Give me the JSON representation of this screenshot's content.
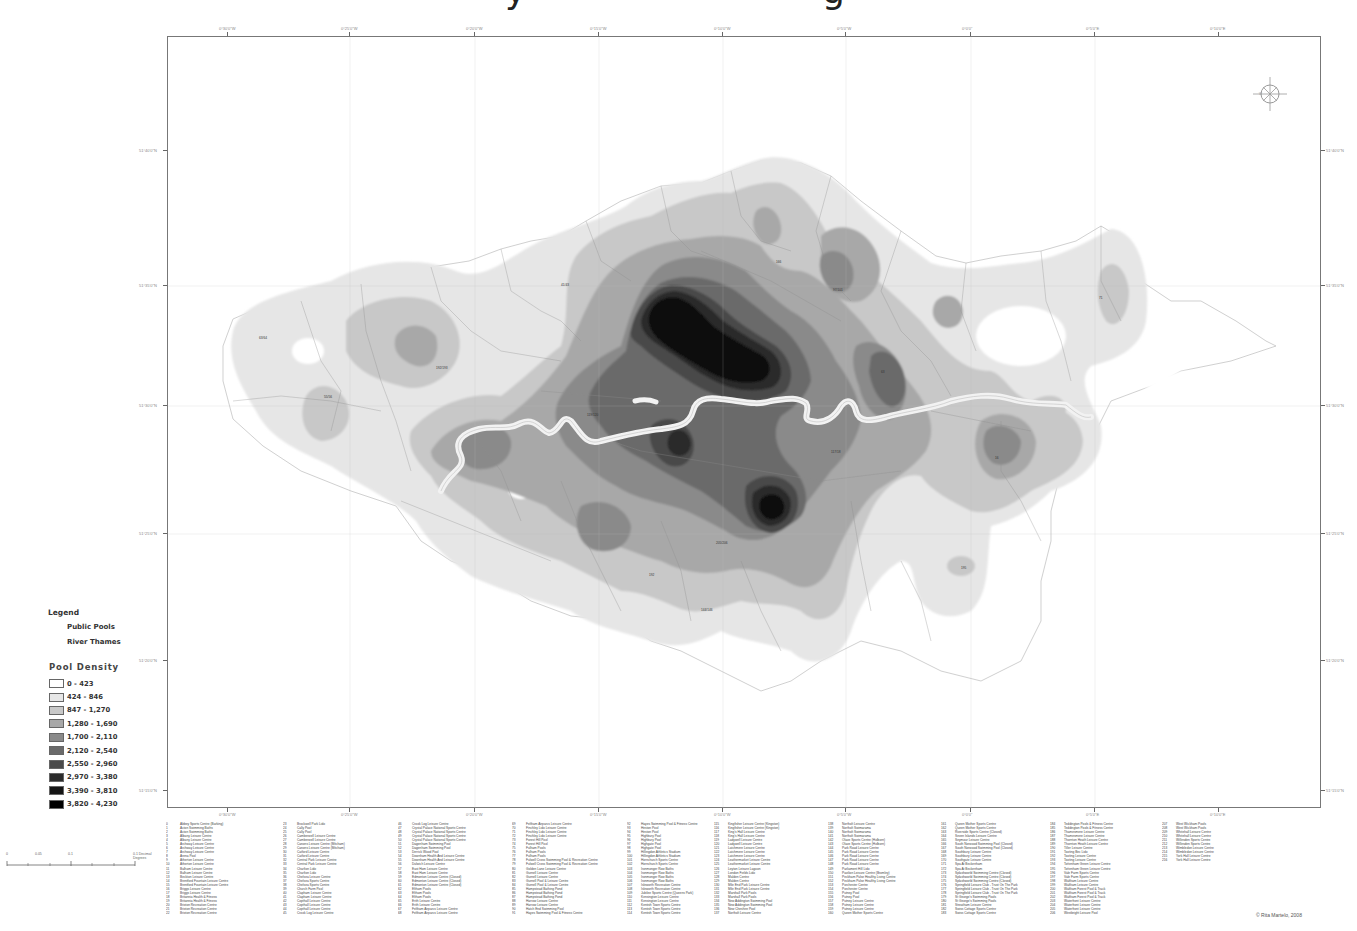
{
  "title": {
    "fragments": [
      {
        "text": "y",
        "left": 505
      },
      {
        "text": "g",
        "left": 822
      }
    ]
  },
  "map": {
    "frame": {
      "left": 167,
      "top": 36,
      "width": 1154,
      "height": 772
    },
    "top_ticks_x": [
      227,
      349,
      474,
      598,
      722,
      845,
      970,
      1094,
      1218
    ],
    "top_tick_labels": [
      "0°30'0\"W",
      "0°25'0\"W",
      "0°20'0\"W",
      "0°15'0\"W",
      "0°10'0\"W",
      "0°5'0\"W",
      "0°0'0\"",
      "0°5'0\"E",
      "0°10'0\"E"
    ],
    "bottom_tick_labels": [
      "0°30'0\"W",
      "0°25'0\"W",
      "0°20'0\"W",
      "0°15'0\"W",
      "0°10'0\"W",
      "0°5'0\"W",
      "0°0'0\"",
      "0°5'0\"E",
      "0°10'0\"E"
    ],
    "left_ticks_y": [
      150,
      285,
      405,
      533,
      660,
      790
    ],
    "left_tick_labels": [
      "51°40'0\"N",
      "51°35'0\"N",
      "51°30'0\"N",
      "51°25'0\"N",
      "51°20'0\"N",
      "51°15'0\"N"
    ],
    "right_tick_labels": [
      "51°40'0\"N",
      "51°35'0\"N",
      "51°30'0\"N",
      "51°25'0\"N",
      "51°20'0\"N",
      "51°15'0\"N"
    ],
    "compass_icon": "compass-rose-icon",
    "river_color": "#eeeeee"
  },
  "legend": {
    "title": "Legend",
    "items": [
      {
        "label": "Public Pools",
        "icon": "pool-point-icon"
      },
      {
        "label": "River Thames",
        "icon": "river-line-icon"
      }
    ]
  },
  "density": {
    "title": "Pool Density",
    "classes": [
      {
        "label": "0 - 423",
        "color": "#ffffff"
      },
      {
        "label": "424 - 846",
        "color": "#e6e6e6"
      },
      {
        "label": "847 - 1,270",
        "color": "#c8c8c8"
      },
      {
        "label": "1,280 - 1,690",
        "color": "#a8a8a8"
      },
      {
        "label": "1,700 - 2,110",
        "color": "#8a8a8a"
      },
      {
        "label": "2,120 - 2,540",
        "color": "#6a6a6a"
      },
      {
        "label": "2,550 - 2,960",
        "color": "#4a4a4a"
      },
      {
        "label": "2,970 - 3,380",
        "color": "#2c2c2c"
      },
      {
        "label": "3,390 - 3,810",
        "color": "#151515"
      },
      {
        "label": "3,820 - 4,230",
        "color": "#000000"
      }
    ]
  },
  "scale_bar": {
    "labels": [
      "0",
      "0.05",
      "0.1",
      "0.1 Decimal Degrees"
    ]
  },
  "footnotes": {
    "columns": [
      [
        [
          "0",
          "Abbey Sports Centre (Barking)"
        ],
        [
          "1",
          "Acton Swimming Baths"
        ],
        [
          "2",
          "Acton Swimming Baths"
        ],
        [
          "3",
          "Albany Leisure Centre"
        ],
        [
          "4",
          "Albany Leisure Centre"
        ],
        [
          "5",
          "Archway Leisure Centre"
        ],
        [
          "6",
          "Archway Leisure Centre"
        ],
        [
          "7",
          "Archway Leisure Centre"
        ],
        [
          "8",
          "Arena Pool"
        ],
        [
          "9",
          "Atherton Leisure Centre"
        ],
        [
          "10",
          "Atherton Leisure Centre"
        ],
        [
          "11",
          "Balham Leisure Centre"
        ],
        [
          "12",
          "Balham Leisure Centre"
        ],
        [
          "13",
          "Beckton Leisure Centre"
        ],
        [
          "14",
          "Brentford Fountain Leisure Centre"
        ],
        [
          "15",
          "Brentford Fountain Leisure Centre"
        ],
        [
          "16",
          "Briggs Leisure Centre"
        ],
        [
          "17",
          "Briggs Leisure Centre"
        ],
        [
          "18",
          "Britannia Health & Fitness"
        ],
        [
          "19",
          "Britannia Health & Fitness"
        ],
        [
          "20",
          "Brixton Recreation Centre"
        ],
        [
          "21",
          "Brixton Recreation Centre"
        ],
        [
          "22",
          "Brixton Recreation Centre"
        ]
      ],
      [
        [
          "23",
          "Brockwell Park Lido"
        ],
        [
          "24",
          "Cally Pool"
        ],
        [
          "25",
          "Cally Pool"
        ],
        [
          "26",
          "Camberwell Leisure Centre"
        ],
        [
          "27",
          "Camberwell Leisure Centre"
        ],
        [
          "28",
          "Canons Leisure Centre (Mitcham)"
        ],
        [
          "29",
          "Canons Leisure Centre (Mitcham)"
        ],
        [
          "30",
          "Catford Leisure Centre"
        ],
        [
          "31",
          "Catford Leisure Centre"
        ],
        [
          "32",
          "Central Park Leisure Centre"
        ],
        [
          "33",
          "Central Park Leisure Centre"
        ],
        [
          "34",
          "Charlton Lido"
        ],
        [
          "35",
          "Charlton Lido"
        ],
        [
          "36",
          "Chelsea Leisure Centre"
        ],
        [
          "37",
          "Chelsea Sports Centre"
        ],
        [
          "38",
          "Chelsea Sports Centre"
        ],
        [
          "39",
          "Church Farm Pool"
        ],
        [
          "40",
          "Clapham Leisure Centre"
        ],
        [
          "41",
          "Clapham Leisure Centre"
        ],
        [
          "42",
          "Copthall Leisure Centre"
        ],
        [
          "43",
          "Copthall Leisure Centre"
        ],
        [
          "44",
          "Copthall Leisure Centre"
        ],
        [
          "45",
          "Crook Log Leisure Centre"
        ]
      ],
      [
        [
          "46",
          "Crook Log Leisure Centre"
        ],
        [
          "47",
          "Crystal Palace National Sports Centre"
        ],
        [
          "48",
          "Crystal Palace National Sports Centre"
        ],
        [
          "49",
          "Crystal Palace National Sports Centre"
        ],
        [
          "50",
          "Crystal Palace National Sports Centre"
        ],
        [
          "51",
          "Dagenham Swimming Pool"
        ],
        [
          "52",
          "Dagenham Swimming Pool"
        ],
        [
          "53",
          "Derrick Wood Pool"
        ],
        [
          "54",
          "Downham Health And Leisure Centre"
        ],
        [
          "55",
          "Downham Health And Leisure Centre"
        ],
        [
          "56",
          "Dulwich Leisure Centre"
        ],
        [
          "57",
          "East Ham Leisure Centre"
        ],
        [
          "58",
          "East Ham Leisure Centre"
        ],
        [
          "59",
          "Edmonton Leisure Centre (Closed)"
        ],
        [
          "60",
          "Edmonton Leisure Centre (Closed)"
        ],
        [
          "61",
          "Edmonton Leisure Centre (Closed)"
        ],
        [
          "62",
          "Eltham Pools"
        ],
        [
          "63",
          "Eltham Pools"
        ],
        [
          "64",
          "Eltham Pools"
        ],
        [
          "65",
          "Erith Leisure Centre"
        ],
        [
          "66",
          "Erith Leisure Centre"
        ],
        [
          "67",
          "Feltham Airparcs Leisure Centre"
        ],
        [
          "68",
          "Feltham Airparcs Leisure Centre"
        ]
      ],
      [
        [
          "69",
          "Feltham Airparcs Leisure Centre"
        ],
        [
          "70",
          "Finchley Lido Leisure Centre"
        ],
        [
          "71",
          "Finchley Lido Leisure Centre"
        ],
        [
          "72",
          "Finchley Lido Leisure Centre"
        ],
        [
          "73",
          "Forest Hill Pool"
        ],
        [
          "74",
          "Forest Hill Pool"
        ],
        [
          "75",
          "Fulham Pools"
        ],
        [
          "76",
          "Fulham Pools"
        ],
        [
          "77",
          "Fulham Pools"
        ],
        [
          "78",
          "Fulwell Cross Swimming Pool & Recreation Centre"
        ],
        [
          "79",
          "Fulwell Cross Swimming Pool & Recreation Centre"
        ],
        [
          "80",
          "Golden Lane Leisure Centre"
        ],
        [
          "81",
          "Gurnell Leisure Centre"
        ],
        [
          "82",
          "Gurnell Leisure Centre"
        ],
        [
          "83",
          "Gurnell Pool & Leisure Centre"
        ],
        [
          "84",
          "Gurnell Pool & Leisure Centre"
        ],
        [
          "85",
          "Hampstead Bathing Pond"
        ],
        [
          "86",
          "Hampstead Bathing Pond"
        ],
        [
          "87",
          "Hampstead Bathing Pond"
        ],
        [
          "88",
          "Harrow Leisure Centre"
        ],
        [
          "89",
          "Harrow Leisure Centre"
        ],
        [
          "90",
          "Hatch End Swimming Pool"
        ],
        [
          "91",
          "Hayes Swimming Pool & Fitness Centre"
        ]
      ],
      [
        [
          "92",
          "Hayes Swimming Pool & Fitness Centre"
        ],
        [
          "93",
          "Heston Pool"
        ],
        [
          "94",
          "Heston Pool"
        ],
        [
          "95",
          "Highbury Pool"
        ],
        [
          "96",
          "Highbury Pool"
        ],
        [
          "97",
          "Highgate Pool"
        ],
        [
          "98",
          "Highgate Pool"
        ],
        [
          "99",
          "Hillingdon Athletics Stadium"
        ],
        [
          "100",
          "Hillingdon Athletics Stadium"
        ],
        [
          "101",
          "Hornchurch Sports Centre"
        ],
        [
          "102",
          "Hornchurch Sports Centre"
        ],
        [
          "103",
          "Ironmonger Row Baths"
        ],
        [
          "104",
          "Ironmonger Row Baths"
        ],
        [
          "105",
          "Ironmonger Row Baths"
        ],
        [
          "106",
          "Ironmonger Row Baths"
        ],
        [
          "107",
          "Isleworth Recreation Centre"
        ],
        [
          "108",
          "Isleworth Recreation Centre"
        ],
        [
          "109",
          "Jubilee Sports Centre (Queens Park)"
        ],
        [
          "110",
          "Kensington Leisure Centre"
        ],
        [
          "111",
          "Kensington Leisure Centre"
        ],
        [
          "112",
          "Kentish Town Sports Centre"
        ],
        [
          "113",
          "Kentish Town Sports Centre"
        ],
        [
          "114",
          "Kentish Town Sports Centre"
        ]
      ],
      [
        [
          "115",
          "Kingfisher Leisure Centre (Kingston)"
        ],
        [
          "116",
          "Kingfisher Leisure Centre (Kingston)"
        ],
        [
          "117",
          "King's Hall Leisure Centre"
        ],
        [
          "118",
          "King's Hall Leisure Centre"
        ],
        [
          "119",
          "Ladywell Leisure Centre"
        ],
        [
          "120",
          "Ladywell Leisure Centre"
        ],
        [
          "121",
          "Latchmere Leisure Centre"
        ],
        [
          "122",
          "Latchmere Leisure Centre"
        ],
        [
          "123",
          "Latchmere Leisure Centre"
        ],
        [
          "124",
          "Leathermarket Leisure Centre"
        ],
        [
          "125",
          "Leathermarket Leisure Centre"
        ],
        [
          "126",
          "Leyton Leisure Lagoon"
        ],
        [
          "127",
          "London Fields Lido"
        ],
        [
          "128",
          "Malden Centre"
        ],
        [
          "129",
          "Malden Centre"
        ],
        [
          "130",
          "Mile End Park Leisure Centre"
        ],
        [
          "131",
          "Mile End Park Leisure Centre"
        ],
        [
          "132",
          "Marshall Park Pools"
        ],
        [
          "133",
          "Marshall Park Pools"
        ],
        [
          "134",
          "New Addington Swimming Pool"
        ],
        [
          "135",
          "New Addington Swimming Pool"
        ],
        [
          "136",
          "New Cheshire Pool"
        ],
        [
          "137",
          "Northolt Leisure Centre"
        ]
      ],
      [
        [
          "138",
          "Northolt Leisure Centre"
        ],
        [
          "139",
          "Northolt Swimarama"
        ],
        [
          "140",
          "Northolt Swimarama"
        ],
        [
          "141",
          "Northolt Swimarama"
        ],
        [
          "142",
          "Olave Sports Centre (Holborn)"
        ],
        [
          "143",
          "Olave Sports Centre (Holborn)"
        ],
        [
          "144",
          "Park Road Leisure Centre"
        ],
        [
          "145",
          "Park Road Leisure Centre"
        ],
        [
          "146",
          "Park Road Leisure Centre"
        ],
        [
          "147",
          "Park Road Leisure Centre"
        ],
        [
          "148",
          "Park Road Leisure Centre"
        ],
        [
          "149",
          "Parliament Hill Lido"
        ],
        [
          "150",
          "Pavilion Leisure Centre (Bromley)"
        ],
        [
          "151",
          "Peckham Pulse Healthy Living Centre"
        ],
        [
          "152",
          "Peckham Pulse Healthy Living Centre"
        ],
        [
          "153",
          "Porchester Centre"
        ],
        [
          "154",
          "Porchester Centre"
        ],
        [
          "155",
          "Putney Pool"
        ],
        [
          "156",
          "Putney Pool"
        ],
        [
          "157",
          "Putney Leisure Centre"
        ],
        [
          "158",
          "Putney Leisure Centre"
        ],
        [
          "159",
          "Putney Leisure Centre"
        ],
        [
          "160",
          "Queen Mother Sports Centre"
        ]
      ],
      [
        [
          "161",
          "Queen Mother Sports Centre"
        ],
        [
          "162",
          "Queen Mother Sports Centre"
        ],
        [
          "163",
          "Riverside Sports Centre (Closed)"
        ],
        [
          "164",
          "Seven Islands Leisure Centre"
        ],
        [
          "165",
          "Seymour Leisure Centre"
        ],
        [
          "166",
          "South Norwood Swimming Pool (Closed)"
        ],
        [
          "167",
          "South Norwood Swimming Pool (Closed)"
        ],
        [
          "168",
          "Southbury Leisure Centre"
        ],
        [
          "169",
          "Southbury Leisure Centre"
        ],
        [
          "170",
          "Southgate Leisure Centre"
        ],
        [
          "171",
          "Spa At Beckenham"
        ],
        [
          "172",
          "Spa At Beckenham"
        ],
        [
          "173",
          "Splashworld Swimming Centre (Closed)"
        ],
        [
          "174",
          "Splashworld Swimming Centre (Closed)"
        ],
        [
          "175",
          "Splashworld Swimming Centre (Closed)"
        ],
        [
          "176",
          "Springfield Leisure Club - Trust On The Park"
        ],
        [
          "177",
          "Springfield Leisure Club - Trust On The Park"
        ],
        [
          "178",
          "Springfield Leisure Club - Trust On The Park"
        ],
        [
          "179",
          "St George's Swimming Pools"
        ],
        [
          "180",
          "St George's Swimming Pools"
        ],
        [
          "181",
          "Streatham Leisure Centre"
        ],
        [
          "182",
          "Swiss Cottage Sports Centre"
        ],
        [
          "183",
          "Swiss Cottage Sports Centre"
        ]
      ],
      [
        [
          "184",
          "Teddington Pools & Fitness Centre"
        ],
        [
          "185",
          "Teddington Pools & Fitness Centre"
        ],
        [
          "186",
          "Thamesmere Leisure Centre"
        ],
        [
          "187",
          "Thamesmere Leisure Centre"
        ],
        [
          "188",
          "Thornton Heath Leisure Centre"
        ],
        [
          "189",
          "Thornton Heath Leisure Centre"
        ],
        [
          "190",
          "Tiller Leisure Centre"
        ],
        [
          "191",
          "Tooting Bec Lido"
        ],
        [
          "192",
          "Tooting Leisure Centre"
        ],
        [
          "193",
          "Tooting Leisure Centre"
        ],
        [
          "194",
          "Tottenham Green Leisure Centre"
        ],
        [
          "195",
          "Tottenham Green Leisure Centre"
        ],
        [
          "196",
          "Vale Farm Sports Centre"
        ],
        [
          "197",
          "Vale Farm Sports Centre"
        ],
        [
          "198",
          "Waltham Leisure Centre"
        ],
        [
          "199",
          "Waltham Leisure Centre"
        ],
        [
          "200",
          "Waltham Forest Pool & Track"
        ],
        [
          "201",
          "Waltham Forest Pool & Track"
        ],
        [
          "202",
          "Waltham Forest Pool & Track"
        ],
        [
          "203",
          "Waterfront Leisure Centre"
        ],
        [
          "204",
          "Waterfront Leisure Centre"
        ],
        [
          "205",
          "Waterfront Leisure Centre"
        ],
        [
          "206",
          "Westbright Leisure Pool"
        ]
      ],
      [
        [
          "207",
          "West Wickham Pools"
        ],
        [
          "208",
          "West Wickham Pools"
        ],
        [
          "209",
          "Whitehall Leisure Centre"
        ],
        [
          "210",
          "Whitehall Leisure Centre"
        ],
        [
          "211",
          "Willesden Sports Centre"
        ],
        [
          "212",
          "Willesden Sports Centre"
        ],
        [
          "213",
          "Wimbledon Leisure Centre"
        ],
        [
          "214",
          "Wimbledon Leisure Centre"
        ],
        [
          "215",
          "York Hall Leisure Centre"
        ],
        [
          "216",
          "York Hall Leisure Centre"
        ]
      ]
    ],
    "column_left": [
      0,
      117,
      232,
      346,
      461,
      548,
      662,
      775,
      884,
      996
    ]
  },
  "credit": "© Rita Martelo, 2008"
}
